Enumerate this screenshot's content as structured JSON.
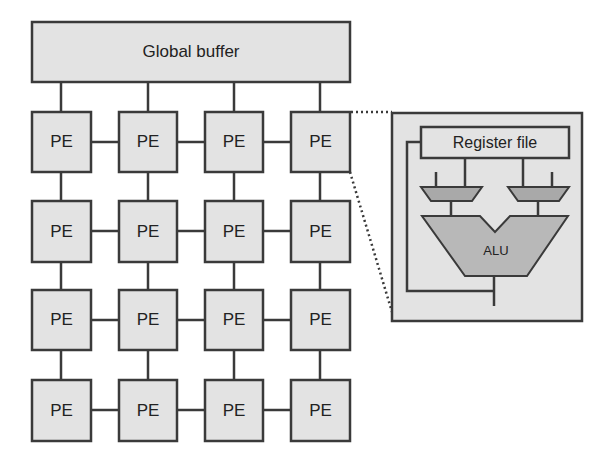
{
  "diagram": {
    "global_buffer": {
      "label": "Global buffer"
    },
    "pe_grid": {
      "rows": 4,
      "cols": 4,
      "cells": [
        [
          "PE",
          "PE",
          "PE",
          "PE"
        ],
        [
          "PE",
          "PE",
          "PE",
          "PE"
        ],
        [
          "PE",
          "PE",
          "PE",
          "PE"
        ],
        [
          "PE",
          "PE",
          "PE",
          "PE"
        ]
      ]
    },
    "pe_detail": {
      "register_file": {
        "label": "Register file"
      },
      "alu": {
        "label": "ALU"
      },
      "muxes": 2
    },
    "colors": {
      "fill": "#e3e3e3",
      "stroke": "#3a3a3a",
      "alu_fill": "#b8b8b8",
      "mux_fill": "#a9a9a9"
    }
  }
}
